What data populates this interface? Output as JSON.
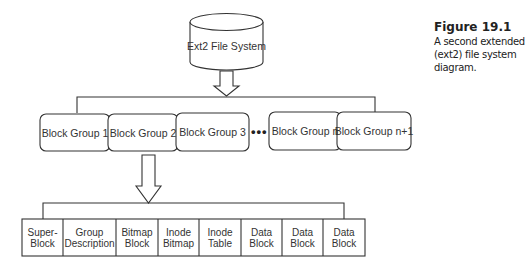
{
  "caption": {
    "figure_label": "Figure 19.1",
    "lines": [
      "A second extended",
      "(ext2) file system",
      "diagram."
    ]
  },
  "root": {
    "label": "Ext2 File System",
    "shape": "cylinder"
  },
  "block_groups": [
    {
      "label": "Block Group 1"
    },
    {
      "label": "Block Group 2"
    },
    {
      "label": "Block Group 3"
    },
    {
      "label": "Block Group n"
    },
    {
      "label": "Block Group n+1"
    }
  ],
  "ellipsis": "•••",
  "block_group_layout": [
    {
      "line1": "Super-",
      "line2": "Block"
    },
    {
      "line1": "Group",
      "line2": "Description"
    },
    {
      "line1": "Bitmap",
      "line2": "Block"
    },
    {
      "line1": "Inode",
      "line2": "Bitmap"
    },
    {
      "line1": "Inode",
      "line2": "Table"
    },
    {
      "line1": "Data",
      "line2": "Block"
    },
    {
      "line1": "Data",
      "line2": "Block"
    },
    {
      "line1": "Data",
      "line2": "Block"
    }
  ]
}
